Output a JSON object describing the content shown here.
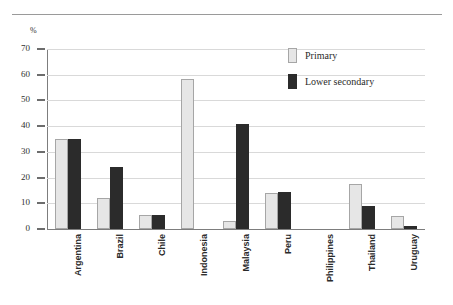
{
  "figure": {
    "caption_fragment": "",
    "y_axis_unit": "%",
    "legend_position": "top-right"
  },
  "chart_data": {
    "type": "bar",
    "title": "",
    "subtitle": "",
    "xlabel": "",
    "ylabel": "%",
    "ylim": [
      0,
      70
    ],
    "yticks": [
      0,
      10,
      20,
      30,
      40,
      50,
      60,
      70
    ],
    "ytick_labels": [
      "0",
      "10",
      "20",
      "30",
      "40",
      "50",
      "60",
      "70"
    ],
    "grid": true,
    "legend": [
      "Primary",
      "Lower secondary"
    ],
    "categories": [
      "Argentina",
      "Brazil",
      "Chile",
      "Indonesia",
      "Malaysia",
      "Peru",
      "Philippines",
      "Thailand",
      "Uruguay"
    ],
    "series": [
      {
        "name": "Primary",
        "color": "#e6e6e6",
        "values": [
          35,
          12,
          5.5,
          58.5,
          3.2,
          14,
          0,
          17.5,
          5.2
        ]
      },
      {
        "name": "Lower secondary",
        "color": "#2b2b2b",
        "values": [
          35,
          24,
          5.5,
          0,
          41,
          14.5,
          0,
          9,
          1
        ]
      }
    ]
  }
}
